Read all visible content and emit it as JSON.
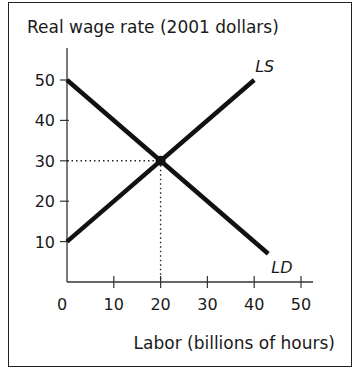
{
  "chart_data": {
    "type": "line",
    "title": "",
    "ylabel": "Real wage rate (2001 dollars)",
    "xlabel": "Labor (billions of hours)",
    "xlim": [
      0,
      50
    ],
    "ylim": [
      0,
      50
    ],
    "xticks": [
      0,
      10,
      20,
      30,
      40,
      50
    ],
    "yticks": [
      10,
      20,
      30,
      40,
      50
    ],
    "grid": false,
    "series": [
      {
        "name": "LS",
        "label": "LS",
        "x": [
          0,
          40
        ],
        "y": [
          10,
          50
        ]
      },
      {
        "name": "LD",
        "label": "LD",
        "x": [
          0,
          43
        ],
        "y": [
          50,
          7
        ]
      }
    ],
    "equilibrium": {
      "x": 20,
      "y": 30
    },
    "annotations": [
      "Dotted guide lines from equilibrium (20, 30) to both axes"
    ]
  },
  "colors": {
    "curve": "#111111",
    "axis": "#333333",
    "guide": "#222222"
  }
}
